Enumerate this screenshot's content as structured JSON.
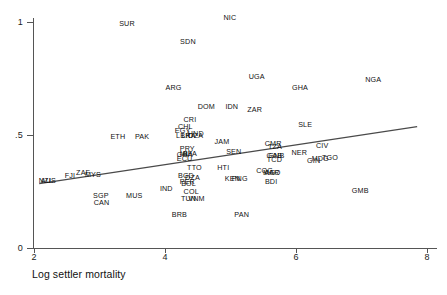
{
  "chart_data": {
    "type": "scatter",
    "title": "",
    "subtitle": "",
    "xlabel": "Log settler mortality",
    "ylabel": "",
    "xlim": [
      2,
      8
    ],
    "ylim": [
      0,
      1
    ],
    "xticks": [
      2,
      4,
      6,
      8
    ],
    "xtick_labels": [
      "2",
      "4",
      "6",
      "8"
    ],
    "yticks": [
      0,
      0.5,
      1
    ],
    "ytick_labels": [
      "0",
      ".5",
      "1"
    ],
    "grid": false,
    "legend": "none",
    "marker_style": "text-label",
    "point_label_field": "label",
    "fit_line": {
      "type": "linear",
      "visible": true,
      "x_start": 2.08,
      "y_start": 0.285,
      "x_end": 7.85,
      "y_end": 0.537
    },
    "points": [
      {
        "label": "SUR",
        "x": 3.42,
        "y": 0.993
      },
      {
        "label": "NIC",
        "x": 4.99,
        "y": 1.018
      },
      {
        "label": "SDN",
        "x": 4.35,
        "y": 0.913
      },
      {
        "label": "UGA",
        "x": 5.4,
        "y": 0.755
      },
      {
        "label": "NGA",
        "x": 7.18,
        "y": 0.745
      },
      {
        "label": "GHA",
        "x": 6.06,
        "y": 0.71
      },
      {
        "label": "ARG",
        "x": 4.13,
        "y": 0.708
      },
      {
        "label": "DOM",
        "x": 4.63,
        "y": 0.623
      },
      {
        "label": "IDN",
        "x": 5.02,
        "y": 0.623
      },
      {
        "label": "ZAR",
        "x": 5.37,
        "y": 0.61
      },
      {
        "label": "CRI",
        "x": 4.38,
        "y": 0.566
      },
      {
        "label": "SLE",
        "x": 6.14,
        "y": 0.546
      },
      {
        "label": "CHL",
        "x": 4.31,
        "y": 0.534
      },
      {
        "label": "EGY",
        "x": 4.27,
        "y": 0.516
      },
      {
        "label": "HND",
        "x": 4.47,
        "y": 0.505
      },
      {
        "label": "LKA",
        "x": 4.36,
        "y": 0.495
      },
      {
        "label": "LBR",
        "x": 4.28,
        "y": 0.495
      },
      {
        "label": "DZA",
        "x": 4.47,
        "y": 0.495
      },
      {
        "label": "ETH",
        "x": 3.28,
        "y": 0.49
      },
      {
        "label": "PAK",
        "x": 3.65,
        "y": 0.49
      },
      {
        "label": "JAM",
        "x": 4.87,
        "y": 0.468
      },
      {
        "label": "CIV",
        "x": 6.4,
        "y": 0.453
      },
      {
        "label": "CMR",
        "x": 5.65,
        "y": 0.462
      },
      {
        "label": "TZA",
        "x": 5.68,
        "y": 0.447
      },
      {
        "label": "PRY",
        "x": 4.34,
        "y": 0.44
      },
      {
        "label": "SEN",
        "x": 5.05,
        "y": 0.425
      },
      {
        "label": "NER",
        "x": 6.05,
        "y": 0.422
      },
      {
        "label": "MLI",
        "x": 4.32,
        "y": 0.415
      },
      {
        "label": "BFA",
        "x": 4.38,
        "y": 0.415
      },
      {
        "label": "GHA2",
        "x": 4.3,
        "y": 0.413
      },
      {
        "label": "GAB",
        "x": 5.67,
        "y": 0.405
      },
      {
        "label": "GNB",
        "x": 5.7,
        "y": 0.405
      },
      {
        "label": "MDG",
        "x": 6.37,
        "y": 0.395
      },
      {
        "label": "TGO",
        "x": 6.52,
        "y": 0.4
      },
      {
        "label": "TCD",
        "x": 5.67,
        "y": 0.388
      },
      {
        "label": "GIN",
        "x": 6.27,
        "y": 0.383
      },
      {
        "label": "ECU",
        "x": 4.3,
        "y": 0.392
      },
      {
        "label": "ZAF",
        "x": 2.75,
        "y": 0.33
      },
      {
        "label": "MYS",
        "x": 2.9,
        "y": 0.325
      },
      {
        "label": "FJI",
        "x": 2.55,
        "y": 0.318
      },
      {
        "label": "TTO",
        "x": 4.45,
        "y": 0.352
      },
      {
        "label": "HTI",
        "x": 4.89,
        "y": 0.352
      },
      {
        "label": "COG",
        "x": 5.52,
        "y": 0.34
      },
      {
        "label": "MAR",
        "x": 5.62,
        "y": 0.332
      },
      {
        "label": "AGO",
        "x": 5.64,
        "y": 0.33
      },
      {
        "label": "BGD",
        "x": 4.32,
        "y": 0.318
      },
      {
        "label": "DZA2",
        "x": 4.42,
        "y": 0.31
      },
      {
        "label": "KEN",
        "x": 5.03,
        "y": 0.305
      },
      {
        "label": "PNG",
        "x": 5.14,
        "y": 0.305
      },
      {
        "label": "NZL",
        "x": 2.18,
        "y": 0.298
      },
      {
        "label": "AUS",
        "x": 2.22,
        "y": 0.298
      },
      {
        "label": "BDI",
        "x": 5.62,
        "y": 0.29
      },
      {
        "label": "PER",
        "x": 4.34,
        "y": 0.292
      },
      {
        "label": "BOL",
        "x": 4.36,
        "y": 0.285
      },
      {
        "label": "IND",
        "x": 4.02,
        "y": 0.262
      },
      {
        "label": "COL",
        "x": 4.4,
        "y": 0.25
      },
      {
        "label": "GMB",
        "x": 6.98,
        "y": 0.252
      },
      {
        "label": "SGP",
        "x": 3.02,
        "y": 0.23
      },
      {
        "label": "MUS",
        "x": 3.53,
        "y": 0.232
      },
      {
        "label": "TUN",
        "x": 4.36,
        "y": 0.218
      },
      {
        "label": "VNM",
        "x": 4.48,
        "y": 0.218
      },
      {
        "label": "CAN",
        "x": 3.03,
        "y": 0.198
      },
      {
        "label": "BRB",
        "x": 4.22,
        "y": 0.148
      },
      {
        "label": "PAN",
        "x": 5.17,
        "y": 0.145
      }
    ]
  },
  "axes": {
    "x_title": "Log settler mortality"
  }
}
